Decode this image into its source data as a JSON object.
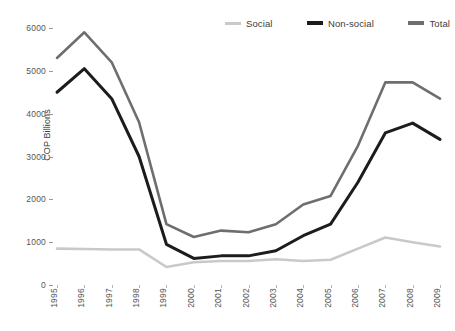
{
  "chart_data": {
    "type": "line",
    "title": "",
    "xlabel": "",
    "ylabel": "COP Billions",
    "categories": [
      "1995",
      "1996",
      "1997",
      "1998",
      "1999",
      "2000",
      "2001",
      "2002",
      "2003",
      "2004",
      "2005",
      "2006",
      "2007",
      "2008",
      "2009"
    ],
    "ylim": [
      0,
      6000
    ],
    "yticks": [
      0,
      1000,
      2000,
      3000,
      4000,
      5000,
      6000
    ],
    "ytick_labels": [
      "0",
      "1000",
      "2000",
      "3000",
      "4000",
      "5000",
      "6000"
    ],
    "grid": false,
    "legend_position": "top-right",
    "series": [
      {
        "name": "Social",
        "color": "#c9c9c9",
        "values": [
          850,
          840,
          830,
          830,
          420,
          530,
          560,
          560,
          600,
          560,
          590,
          850,
          1110,
          1000,
          900
        ]
      },
      {
        "name": "Non-social",
        "color": "#1c1c1c",
        "values": [
          4500,
          5050,
          4350,
          3000,
          950,
          620,
          680,
          680,
          800,
          1150,
          1420,
          2400,
          3550,
          3780,
          3400
        ]
      },
      {
        "name": "Total",
        "color": "#6e6e6e",
        "values": [
          5300,
          5900,
          5200,
          3800,
          1420,
          1120,
          1270,
          1230,
          1420,
          1880,
          2080,
          3250,
          4730,
          4730,
          4350
        ]
      }
    ]
  },
  "legend": {
    "items": [
      {
        "label": "Social",
        "color": "#c9c9c9"
      },
      {
        "label": "Non-social",
        "color": "#1c1c1c"
      },
      {
        "label": "Total",
        "color": "#6e6e6e"
      }
    ]
  },
  "axes": {
    "y_title": "COP Billions"
  }
}
